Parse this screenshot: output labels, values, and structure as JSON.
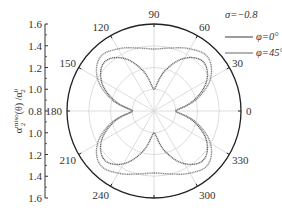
{
  "chart_data": {
    "type": "polar-line",
    "title": "",
    "annotation": "σ=−0.8",
    "ylabel": "α₂^miso (θ) / α₂⁰",
    "radial_axis": {
      "center_value": 0.8,
      "outer_value": 1.6,
      "ticks": [
        0.8,
        1.0,
        1.2,
        1.4,
        1.6
      ],
      "left_axis_labels_top": [
        "1.6",
        "1.4",
        "1.2",
        "1.0",
        "0.8"
      ],
      "left_axis_labels_bottom": [
        "1.0",
        "1.2",
        "1.4",
        "1.6"
      ]
    },
    "angular_axis": {
      "unit": "deg",
      "ticks": [
        0,
        30,
        60,
        90,
        120,
        150,
        180,
        210,
        240,
        270,
        300,
        330
      ],
      "labels": [
        "0",
        "30",
        "60",
        "90",
        "120",
        "150",
        "180",
        "210",
        "240",
        "",
        "300",
        "330"
      ]
    },
    "grid": true,
    "legend_position": "top-right",
    "series": [
      {
        "name": "φ=0°",
        "color": "#666666",
        "theta": [
          0,
          15,
          30,
          45,
          60,
          75,
          90,
          105,
          120,
          135,
          150,
          165,
          180,
          195,
          210,
          225,
          240,
          255,
          270,
          285,
          300,
          315,
          330,
          345,
          360
        ],
        "r": [
          1.0,
          1.18,
          1.36,
          1.44,
          1.36,
          1.18,
          1.0,
          1.18,
          1.36,
          1.44,
          1.36,
          1.18,
          1.0,
          1.18,
          1.36,
          1.44,
          1.36,
          1.18,
          1.0,
          1.18,
          1.36,
          1.44,
          1.36,
          1.18,
          1.0
        ]
      },
      {
        "name": "φ=45°",
        "color": "#8a8a8a",
        "theta": [
          0,
          15,
          30,
          45,
          60,
          75,
          90,
          105,
          120,
          135,
          150,
          165,
          180,
          195,
          210,
          225,
          240,
          255,
          270,
          285,
          300,
          315,
          330,
          345,
          360
        ],
        "r": [
          1.0,
          1.2,
          1.4,
          1.5,
          1.46,
          1.4,
          1.37,
          1.4,
          1.46,
          1.5,
          1.4,
          1.2,
          1.0,
          1.2,
          1.4,
          1.5,
          1.46,
          1.4,
          1.37,
          1.4,
          1.46,
          1.5,
          1.4,
          1.2,
          1.0
        ]
      }
    ]
  },
  "legend": {
    "annotation": "σ=−0.8",
    "items": [
      {
        "label": "φ=0°"
      },
      {
        "label": "φ=45°"
      }
    ]
  },
  "axis": {
    "ylabel_main": "α",
    "ylabel_sup": "miso",
    "ylabel_sub": "2",
    "ylabel_rest": " (θ) /α",
    "ylabel_sup2": "0",
    "ylabel_sub2": "2"
  }
}
